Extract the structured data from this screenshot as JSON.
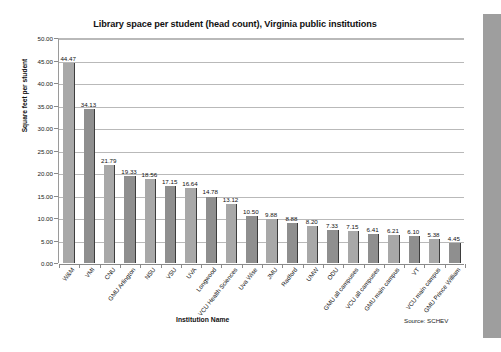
{
  "chart_data": {
    "type": "bar",
    "title": "Library space per student (head count), Virginia public institutions",
    "xlabel": "Institution Name",
    "ylabel": "Square feet per student",
    "ylim": [
      0,
      50
    ],
    "ytick_step": 5,
    "ytick_labels": [
      "0.00",
      "5.00",
      "10.00",
      "15.00",
      "20.00",
      "25.00",
      "30.00",
      "35.00",
      "40.00",
      "45.00",
      "50.00"
    ],
    "grid": true,
    "legend": "none",
    "source_note": "Source: SCHEV",
    "bar_face_color": "#a8a8a8",
    "bar_edge_color": "#3d3d3d",
    "categories": [
      "W&M",
      "VMI",
      "CNU",
      "GMU Arlington",
      "NSU",
      "VSU",
      "UVA",
      "Longwood",
      "VCU Health Sciences",
      "Uva Wise",
      "JMU",
      "Radford",
      "UMW",
      "ODU",
      "GMU all campuses",
      "VCU all campuses",
      "GMU main campus",
      "VT",
      "VCU main campus",
      "GMU Prince William"
    ],
    "values": [
      44.47,
      34.13,
      21.79,
      19.33,
      18.56,
      17.15,
      16.64,
      14.78,
      13.12,
      10.5,
      9.88,
      8.88,
      8.2,
      7.33,
      7.15,
      6.41,
      6.21,
      6.1,
      5.38,
      4.45
    ],
    "value_labels": [
      "44.47",
      "34.13",
      "21.79",
      "19.33",
      "18.56",
      "17.15",
      "16.64",
      "14.78",
      "13.12",
      "10.50",
      "9.88",
      "8.88",
      "8.20",
      "7.33",
      "7.15",
      "6.41",
      "6.21",
      "6.10",
      "5.38",
      "4.45"
    ]
  }
}
